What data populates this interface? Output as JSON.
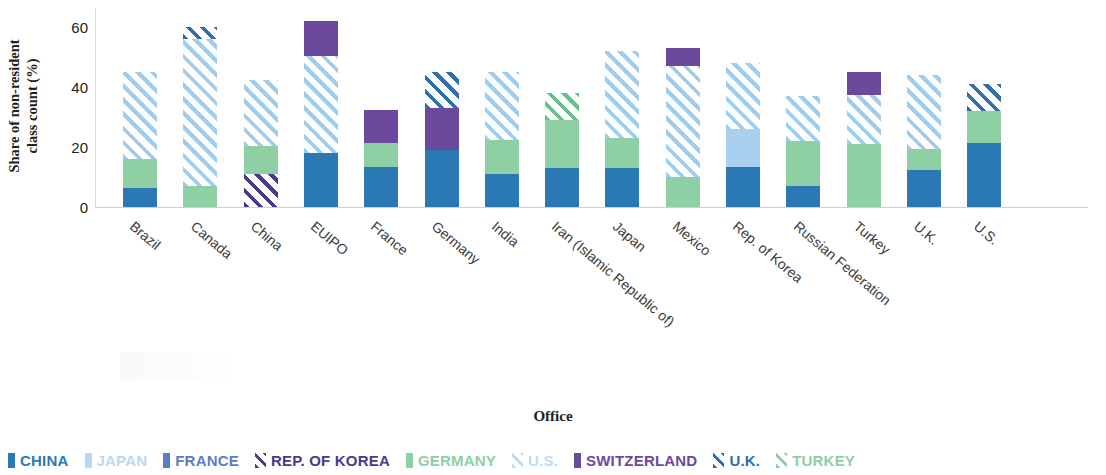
{
  "chart_data": {
    "type": "bar",
    "subtype": "stacked",
    "title": "",
    "xlabel": "Office",
    "ylabel": "Share of non-resident class count (%)",
    "ylim": [
      0,
      63
    ],
    "yticks": [
      0,
      20,
      40,
      60
    ],
    "grid": false,
    "legend_position": "bottom",
    "categories": [
      "Brazil",
      "Canada",
      "China",
      "EUIPO",
      "France",
      "Germany",
      "India",
      "Iran (Islamic Republic of)",
      "Japan",
      "Mexico",
      "Rep. of Korea",
      "Russian Federation",
      "Turkey",
      "U.K.",
      "U.S."
    ],
    "series": [
      {
        "name": "CHINA",
        "key": "china",
        "color": "#2a79b5",
        "pattern": "solid",
        "values": [
          6.5,
          0,
          0,
          18.0,
          13.5,
          19.0,
          11.0,
          13.0,
          13.0,
          0,
          13.5,
          7.0,
          0,
          12.5,
          21.5
        ]
      },
      {
        "name": "JAPAN",
        "key": "japan",
        "color": "#b9d9f2",
        "pattern": "solid",
        "values": [
          0,
          0,
          0,
          0,
          0,
          0,
          0,
          0,
          0,
          0,
          12.5,
          0,
          0,
          0,
          0
        ]
      },
      {
        "name": "FRANCE",
        "key": "france",
        "color": "#5b7cc4",
        "pattern": "solid",
        "values": [
          0,
          0,
          0,
          0,
          0,
          0,
          0,
          0,
          0,
          0,
          0,
          0,
          0,
          0,
          0
        ]
      },
      {
        "name": "REP. OF KOREA",
        "key": "korea",
        "color": "#4a3a8c",
        "pattern": "hatch",
        "values": [
          0,
          0,
          11.0,
          0,
          0,
          0,
          0,
          0,
          0,
          0,
          0,
          0,
          0,
          0,
          0
        ]
      },
      {
        "name": "GERMANY",
        "key": "germany",
        "color": "#8ed0a4",
        "pattern": "solid",
        "values": [
          9.5,
          7.0,
          9.5,
          0,
          8.0,
          0,
          11.5,
          16.0,
          10.0,
          10.0,
          0,
          15.0,
          21.0,
          7.0,
          10.5
        ]
      },
      {
        "name": "U.S.",
        "key": "us",
        "color": "#bcdcf5",
        "pattern": "hatch",
        "values": [
          29.0,
          49.0,
          22.0,
          32.5,
          0,
          0,
          22.5,
          0,
          29.0,
          37.0,
          22.0,
          15.0,
          16.5,
          24.5,
          0
        ]
      },
      {
        "name": "SWITZERLAND",
        "key": "switzerland",
        "color": "#6b4a9e",
        "pattern": "solid",
        "values": [
          0,
          0,
          0,
          11.5,
          11.0,
          14.0,
          0,
          0,
          0,
          6.0,
          0,
          0,
          7.5,
          0,
          0
        ]
      },
      {
        "name": "U.K.",
        "key": "uk",
        "color": "#2f6fae",
        "pattern": "hatch",
        "values": [
          0,
          4.0,
          0,
          0,
          0,
          12.0,
          0,
          0,
          0,
          0,
          0,
          0,
          0,
          0,
          9.0
        ]
      },
      {
        "name": "TURKEY",
        "key": "turkey",
        "color": "#8ed0a4",
        "pattern": "hatch",
        "values": [
          0,
          0,
          0,
          0,
          0,
          0,
          0,
          9.0,
          0,
          0,
          0,
          0,
          0,
          0,
          0
        ]
      }
    ],
    "stack_order": [
      "china",
      "japan",
      "france",
      "korea",
      "germany",
      "us",
      "switzerland",
      "uk",
      "turkey"
    ],
    "bar_totals": [
      45.0,
      60.0,
      42.5,
      62.0,
      32.5,
      45.0,
      45.0,
      38.0,
      52.0,
      53.0,
      48.0,
      37.0,
      45.0,
      44.0,
      41.0
    ]
  },
  "axes": {
    "y_title_line1": "Share of non-resident",
    "y_title_line2": "class count (%)",
    "y_tick_labels": [
      "60",
      "40",
      "20",
      "0"
    ],
    "x_title": "Office"
  },
  "legend": {
    "items": [
      {
        "label": "CHINA",
        "key": "china",
        "pattern": "solid"
      },
      {
        "label": "JAPAN",
        "key": "japan",
        "pattern": "solid"
      },
      {
        "label": "FRANCE",
        "key": "france",
        "pattern": "solid"
      },
      {
        "label": "REP. OF KOREA",
        "key": "korea",
        "pattern": "hatch"
      },
      {
        "label": "GERMANY",
        "key": "germany",
        "pattern": "solid"
      },
      {
        "label": "U.S.",
        "key": "us",
        "pattern": "hatch"
      },
      {
        "label": "SWITZERLAND",
        "key": "switzerland",
        "pattern": "solid"
      },
      {
        "label": "U.K.",
        "key": "uk",
        "pattern": "hatch"
      },
      {
        "label": "TURKEY",
        "key": "turkey",
        "pattern": "hatch"
      }
    ]
  }
}
